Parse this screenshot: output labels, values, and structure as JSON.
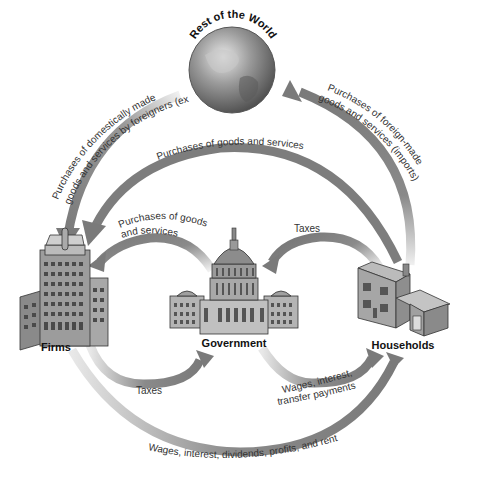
{
  "diagram": {
    "type": "circular-flow",
    "nodes": {
      "world": {
        "label": "Rest of the World"
      },
      "firms": {
        "label": "Firms"
      },
      "government": {
        "label": "Government"
      },
      "households": {
        "label": "Households"
      }
    },
    "flows": {
      "exports": {
        "line1": "Purchases of domestically made",
        "line2": "goods and services by foreigners (exports)",
        "from": "Rest of the World",
        "to": "Firms"
      },
      "imports": {
        "line1": "Purchases of foreign-made",
        "line2": "goods and services (imports)",
        "from": "Households",
        "to": "Rest of the World"
      },
      "household_purchases": {
        "label": "Purchases of goods and services",
        "from": "Households",
        "to": "Firms"
      },
      "gov_purchases": {
        "line1": "Purchases of goods",
        "line2": "and services",
        "from": "Government",
        "to": "Firms"
      },
      "household_taxes": {
        "label": "Taxes",
        "from": "Households",
        "to": "Government"
      },
      "firm_taxes": {
        "label": "Taxes",
        "from": "Firms",
        "to": "Government"
      },
      "gov_payments": {
        "line1": "Wages, interest,",
        "line2": "transfer payments",
        "from": "Government",
        "to": "Households"
      },
      "factor_payments": {
        "label": "Wages, interest, dividends, profits, and rent",
        "from": "Firms",
        "to": "Households"
      }
    },
    "colors": {
      "arrow": "#7a7a7a",
      "arrow_light": "#e6e6e6",
      "text": "#333333",
      "globe": "#8a8a8a"
    }
  }
}
